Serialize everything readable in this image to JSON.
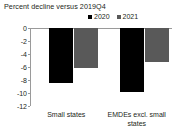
{
  "chart_data": {
    "type": "bar",
    "title": "Percent decline versus 2019Q4",
    "xlabel": "",
    "ylabel": "",
    "ylim": [
      -12,
      0
    ],
    "grid": false,
    "legend_position": "top-right",
    "yticks": [
      "0",
      "-2",
      "-4",
      "-6",
      "-8",
      "-10",
      "-12"
    ],
    "ytick_values": [
      0,
      -2,
      -4,
      -6,
      -8,
      -10,
      -12
    ],
    "categories": [
      "Small states",
      "EMDEs excl. small states"
    ],
    "series": [
      {
        "name": "2020",
        "color": "#000000",
        "values": [
          -8.4,
          -9.8
        ]
      },
      {
        "name": "2021",
        "color": "#595959",
        "values": [
          -6.1,
          -5.3
        ]
      }
    ],
    "axis_color": "#9a9a9a",
    "text_color": "#231f20"
  }
}
